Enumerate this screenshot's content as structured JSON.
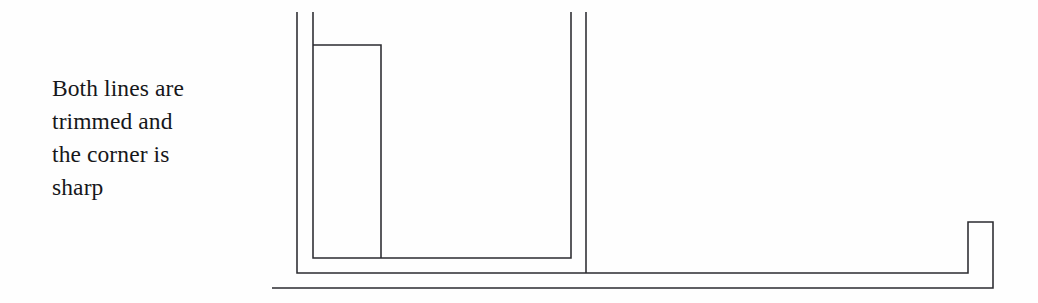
{
  "figure": {
    "background_color": "#fefefe",
    "stroke_color": "#2b2b30",
    "stroke_width": 1.55,
    "width": 1038,
    "height": 303
  },
  "caption": {
    "lines": [
      "Both lines are",
      "trimmed and",
      "the corner is",
      "sharp"
    ],
    "full_text": "Both lines are trimmed and the corner is sharp",
    "color": "#17171a"
  },
  "drawing": {
    "description": "Two parallel polyline outlines meeting at a sharp trimmed corner",
    "paths": [
      {
        "name": "outer-offset-polyline",
        "points": "297,12 297,273 968,273 968,222 993,222 993,288 272,288"
      },
      {
        "name": "inner-polyline",
        "points": "313,12 313,258 571,258 571,12"
      },
      {
        "name": "upper-trim-stub",
        "points": "313,45 381,45 381,258"
      },
      {
        "name": "right-inner-vertical",
        "points": "586,12 586,273"
      }
    ]
  }
}
